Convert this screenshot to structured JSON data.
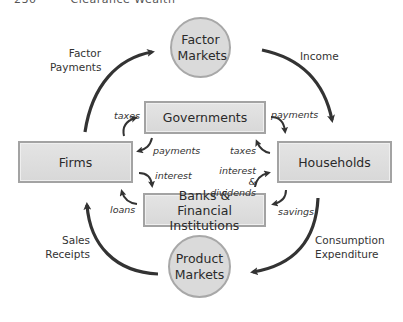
{
  "header": {
    "page_number": "230",
    "running_title": "Clearance Wealth"
  },
  "nodes": {
    "factor_markets": "Factor Markets",
    "product_markets": "Product Markets",
    "firms": "Firms",
    "households": "Households",
    "governments": "Governments",
    "banks": "Banks & Financial Institutions"
  },
  "flows": {
    "factor_payments": "Factor Payments",
    "income": "Income",
    "consumption_expenditure": "Consumption Expenditure",
    "sales_receipts": "Sales Receipts"
  },
  "sub_flows": {
    "firms_taxes": "taxes",
    "gov_payments_to_firms": "payments",
    "gov_payments_to_households": "payments",
    "households_taxes": "taxes",
    "firms_interest": "interest",
    "banks_loans": "loans",
    "households_interest_dividends": "interest & dividends",
    "households_savings": "savings"
  },
  "colors": {
    "node_fill": "#dadada",
    "node_border": "#a3a3a3",
    "arrow": "#333333"
  }
}
